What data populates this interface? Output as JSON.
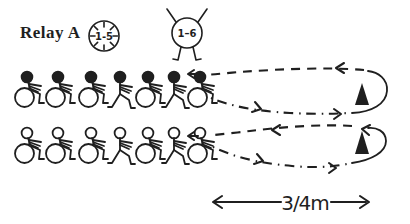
{
  "title": "Relay A",
  "legend": {
    "timer": {
      "icon": "clock-icon",
      "label": "1-5"
    },
    "players": {
      "icon": "player-circle-icon",
      "label": "1–6"
    }
  },
  "teams": {
    "rows": [
      {
        "id": "team-row-1",
        "head_style": "filled",
        "figures": [
          "wheelchair",
          "wheelchair",
          "wheelchair",
          "runner",
          "wheelchair",
          "runner",
          "wheelchair"
        ]
      },
      {
        "id": "team-row-2",
        "head_style": "open",
        "figures": [
          "wheelchair",
          "wheelchair",
          "wheelchair",
          "runner",
          "wheelchair",
          "runner",
          "wheelchair"
        ]
      }
    ]
  },
  "course": {
    "turn_markers": 2,
    "path_style": "dashed-loop"
  },
  "measurement": {
    "label": "3/4m"
  },
  "colors": {
    "ink": "#1f1f1f",
    "background": "#ffffff"
  }
}
